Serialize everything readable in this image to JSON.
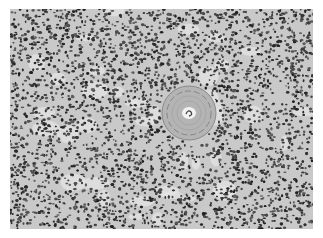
{
  "image": {
    "kind": "grayscale histology micrograph",
    "description": "Dense field of small dark-staining cells with a central round concentric eosinophilic body containing a small central lumen",
    "background_color": "#ffffff",
    "tissue_base_color": "#c9c9c9",
    "nucleus_color": "#2e2e2e",
    "central_structure": {
      "center_x": 189,
      "center_y": 113,
      "outer_radius": 27,
      "inner_lumen_radius": 7,
      "color": "#b4b4b4"
    }
  }
}
